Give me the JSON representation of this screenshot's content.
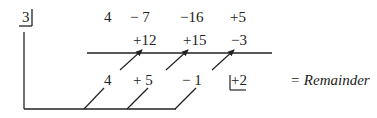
{
  "divisor": "3",
  "rows": {
    "coefficients": [
      "4",
      "− 7",
      "−16",
      "+5"
    ],
    "products": [
      "+12",
      "+15",
      "−3"
    ],
    "results": [
      "4",
      "+ 5",
      "− 1",
      "+2"
    ]
  },
  "remainder_label": "= Remainder",
  "colors": {
    "ink": "#222222",
    "background": "#ffffff"
  }
}
